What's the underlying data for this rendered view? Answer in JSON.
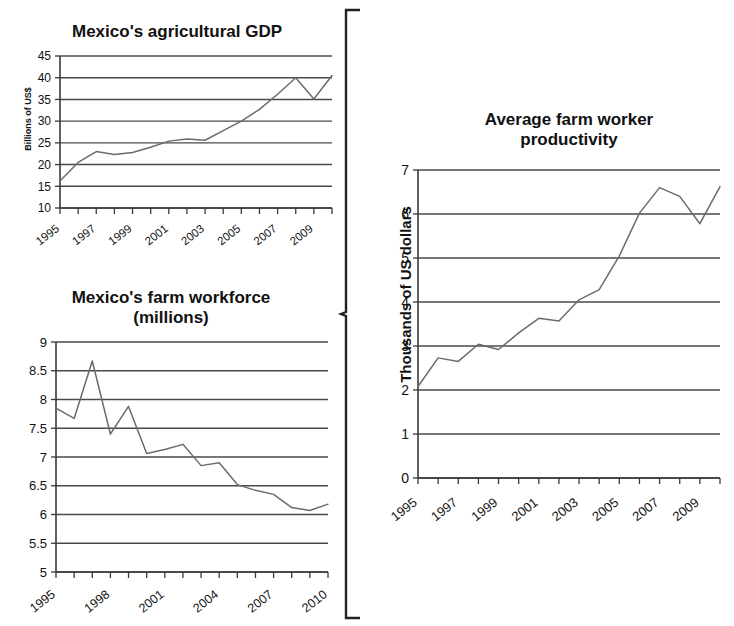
{
  "figure": {
    "background": "#ffffff",
    "line_color": "#6b6b6b",
    "grid_color": "#4a4a4a",
    "axis_color": "#3a3a3a",
    "brace_label": "curly-brace-grouping-left-charts"
  },
  "charts": [
    {
      "id": "agricultural-gdp",
      "title": "Mexico's agricultural GDP",
      "ylabel": "Billions of US$",
      "xlabel": "",
      "x_tick_labels": [
        "1995",
        "1997",
        "1999",
        "2001",
        "2003",
        "2005",
        "2007",
        "2009"
      ],
      "y_tick_labels": [
        "10",
        "15",
        "20",
        "25",
        "30",
        "35",
        "40",
        "45"
      ]
    },
    {
      "id": "farm-workforce",
      "title_line1": "Mexico's farm workforce",
      "title_line2": "(millions)",
      "title": "Mexico's farm workforce (millions)",
      "ylabel": "",
      "xlabel": "",
      "x_tick_labels": [
        "1995",
        "1998",
        "2001",
        "2004",
        "2007",
        "2010"
      ],
      "y_tick_labels": [
        "5",
        "5.5",
        "6",
        "6.5",
        "7",
        "7.5",
        "8",
        "8.5",
        "9"
      ]
    },
    {
      "id": "worker-productivity",
      "title_line1": "Average farm worker",
      "title_line2": "productivity",
      "title": "Average farm worker productivity",
      "ylabel": "Thousands of US dollars",
      "xlabel": "",
      "x_tick_labels": [
        "1995",
        "1997",
        "1999",
        "2001",
        "2003",
        "2005",
        "2007",
        "2009"
      ],
      "y_tick_labels": [
        "0",
        "1",
        "2",
        "3",
        "4",
        "5",
        "6",
        "7"
      ]
    }
  ],
  "chart_data": [
    {
      "type": "line",
      "id": "agricultural-gdp",
      "title": "Mexico's agricultural GDP",
      "xlabel": "",
      "ylabel": "Billions of US$",
      "x": [
        1995,
        1996,
        1997,
        1998,
        1999,
        2000,
        2001,
        2002,
        2003,
        2004,
        2005,
        2006,
        2007,
        2008,
        2009,
        2010
      ],
      "values": [
        16.2,
        20.5,
        23.0,
        22.3,
        22.8,
        24.0,
        25.4,
        25.9,
        25.6,
        27.8,
        30.0,
        32.7,
        36.2,
        40.0,
        35.1,
        40.5
      ],
      "xlim": [
        1995,
        2010
      ],
      "ylim": [
        10,
        45
      ],
      "ytick_step": 5,
      "xtick_labels": [
        "1995",
        "1997",
        "1999",
        "2001",
        "2003",
        "2005",
        "2007",
        "2009"
      ],
      "xtick_label_step": 2,
      "grid": true,
      "legend": "none"
    },
    {
      "type": "line",
      "id": "farm-workforce",
      "title": "Mexico's farm workforce (millions)",
      "xlabel": "",
      "ylabel": "",
      "x": [
        1995,
        1996,
        1997,
        1998,
        1999,
        2000,
        2001,
        2002,
        2003,
        2004,
        2005,
        2006,
        2007,
        2008,
        2009,
        2010
      ],
      "values": [
        7.85,
        7.67,
        8.67,
        7.4,
        7.88,
        7.06,
        7.13,
        7.22,
        6.85,
        6.9,
        6.52,
        6.42,
        6.35,
        6.12,
        6.07,
        6.18
      ],
      "xlim": [
        1995,
        2010
      ],
      "ylim": [
        5,
        9
      ],
      "ytick_step": 0.5,
      "xtick_labels": [
        "1995",
        "1998",
        "2001",
        "2004",
        "2007",
        "2010"
      ],
      "xtick_label_step": 3,
      "grid": true,
      "legend": "none"
    },
    {
      "type": "line",
      "id": "worker-productivity",
      "title": "Average farm worker productivity",
      "xlabel": "",
      "ylabel": "Thousands of US dollars",
      "x": [
        1995,
        1996,
        1997,
        1998,
        1999,
        2000,
        2001,
        2002,
        2003,
        2004,
        2005,
        2006,
        2007,
        2008,
        2009,
        2010
      ],
      "values": [
        2.08,
        2.73,
        2.65,
        3.04,
        2.92,
        3.3,
        3.63,
        3.57,
        4.05,
        4.28,
        5.05,
        6.02,
        6.6,
        6.4,
        5.78,
        6.62
      ],
      "xlim": [
        1995,
        2010
      ],
      "ylim": [
        0,
        7
      ],
      "ytick_step": 1,
      "xtick_labels": [
        "1995",
        "1997",
        "1999",
        "2001",
        "2003",
        "2005",
        "2007",
        "2009"
      ],
      "xtick_label_step": 2,
      "grid": true,
      "legend": "none"
    }
  ]
}
